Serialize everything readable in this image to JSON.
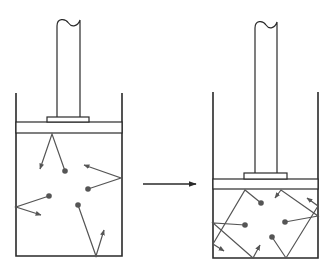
{
  "diagram": {
    "title": "",
    "colors": {
      "outline": "#2a2a2a",
      "molecule": "#555555",
      "background": "#ffffff"
    },
    "left_cylinder": {
      "label": "",
      "state": "expanded",
      "walls": {
        "left_x": 16,
        "right_x": 122,
        "top_y": 93,
        "bottom_y": 256
      },
      "piston": {
        "top_y": 122,
        "bottom_y": 133,
        "block": {
          "x1": 47,
          "x2": 89,
          "top_y": 117
        }
      },
      "rod": {
        "x1": 57,
        "x2": 80,
        "top_y": 20
      },
      "molecules": [
        {
          "dot": [
            65,
            171
          ],
          "path": [
            [
              65,
              171
            ],
            [
              52,
              134
            ],
            [
              40,
              169
            ]
          ]
        },
        {
          "dot": [
            88,
            189
          ],
          "path": [
            [
              88,
              189
            ],
            [
              121,
              178
            ],
            [
              84,
              165
            ]
          ]
        },
        {
          "dot": [
            49,
            196
          ],
          "path": [
            [
              49,
              196
            ],
            [
              16,
              207
            ],
            [
              41,
              215
            ]
          ]
        },
        {
          "dot": [
            78,
            205
          ],
          "path": [
            [
              78,
              205
            ],
            [
              96,
              256
            ],
            [
              104,
              230
            ]
          ]
        }
      ]
    },
    "arrow": {
      "label": "",
      "from": [
        143,
        184
      ],
      "to": [
        196,
        184
      ]
    },
    "right_cylinder": {
      "label": "",
      "state": "compressed",
      "walls": {
        "left_x": 213,
        "right_x": 318,
        "top_y": 92,
        "bottom_y": 258
      },
      "piston": {
        "top_y": 179,
        "bottom_y": 189,
        "block": {
          "x1": 244,
          "x2": 287,
          "top_y": 173
        }
      },
      "rod": {
        "x1": 255,
        "x2": 277,
        "top_y": 22
      },
      "molecules": [
        {
          "dot": [
            261,
            203
          ],
          "path": [
            [
              261,
              203
            ],
            [
              245,
              190
            ],
            [
              213,
              244
            ],
            [
              224,
              251
            ]
          ]
        },
        {
          "dot": [
            245,
            225
          ],
          "path": [
            [
              245,
              225
            ],
            [
              213,
              223
            ],
            [
              253,
              258
            ],
            [
              260,
              245
            ]
          ]
        },
        {
          "dot": [
            285,
            222
          ],
          "path": [
            [
              285,
              222
            ],
            [
              318,
              216
            ],
            [
              281,
              190
            ],
            [
              275,
              198
            ]
          ]
        },
        {
          "dot": [
            272,
            237
          ],
          "path": [
            [
              272,
              237
            ],
            [
              286,
              258
            ],
            [
              318,
              206
            ],
            [
              307,
              198
            ]
          ]
        }
      ]
    }
  }
}
